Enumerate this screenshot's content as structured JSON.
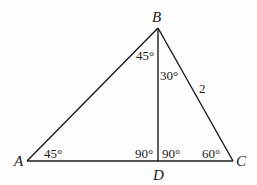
{
  "diagram": {
    "type": "geometry-triangle",
    "vertices": {
      "A": {
        "label": "A",
        "x": 27,
        "y": 161
      },
      "B": {
        "label": "B",
        "x": 158,
        "y": 28
      },
      "C": {
        "label": "C",
        "x": 233,
        "y": 161
      },
      "D": {
        "label": "D",
        "x": 158,
        "y": 161
      }
    },
    "segments": [
      "AB",
      "BC",
      "CA",
      "BD"
    ],
    "angles": {
      "A": "45°",
      "ABD": "45°",
      "DBC": "30°",
      "ADB": "90°",
      "BDC": "90°",
      "C": "60°"
    },
    "side_labels": {
      "BC": "2"
    },
    "line_color": "#1a1a1a"
  }
}
